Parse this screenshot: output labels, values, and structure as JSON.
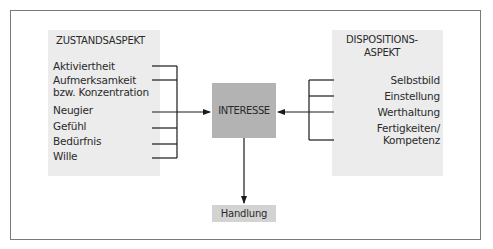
{
  "diagram": {
    "left_panel": {
      "title": "ZUSTANDSASPEKT",
      "items": [
        {
          "label": "Aktiviertheit"
        },
        {
          "label": "Aufmerksamkeit"
        },
        {
          "label": "bzw. Konzentration"
        },
        {
          "label": "Neugier"
        },
        {
          "label": "Gefühl"
        },
        {
          "label": "Bedürfnis"
        },
        {
          "label": "Wille"
        }
      ]
    },
    "right_panel": {
      "title_line1": "DISPOSITIONS-",
      "title_line2": "ASPEKT",
      "items": [
        {
          "label": "Selbstbild"
        },
        {
          "label": "Einstellung"
        },
        {
          "label": "Werthaltung"
        },
        {
          "label": "Fertigkeiten/"
        },
        {
          "label": "Kompetenz"
        }
      ]
    },
    "center_node": {
      "label": "INTERESSE"
    },
    "output_node": {
      "label": "Handlung"
    },
    "colors": {
      "panel_fill": "#ececec",
      "center_fill": "#b3b3b3",
      "output_fill": "#d3d3d3",
      "line": "#1a1a1a",
      "frame": "#7a7a7a"
    }
  }
}
